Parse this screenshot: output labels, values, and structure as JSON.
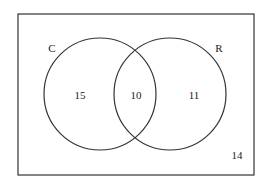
{
  "diagram": {
    "type": "venn",
    "sets": [
      {
        "label": "C"
      },
      {
        "label": "R"
      }
    ],
    "regions": {
      "c_only": "15",
      "c_and_r": "10",
      "r_only": "11",
      "neither": "14"
    },
    "colors": {
      "stroke": "#333333",
      "background": "#ffffff"
    }
  }
}
